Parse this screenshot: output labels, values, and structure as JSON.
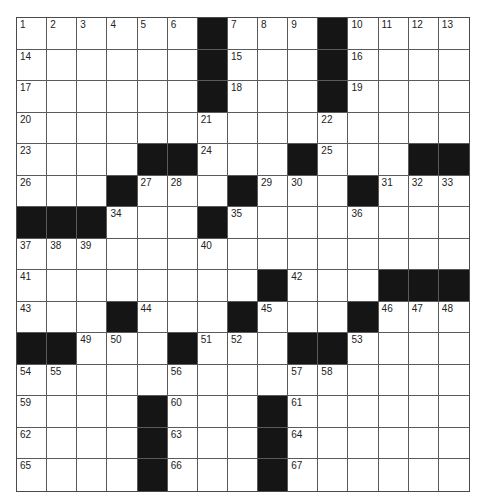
{
  "puzzle": {
    "size": {
      "rows": 15,
      "cols": 15
    },
    "colors": {
      "black": "#151515",
      "white": "#ffffff",
      "line": "#5a5a5a",
      "number": "#222222"
    },
    "layout": [
      "......#...#....",
      "......#...#....",
      "......#...#....",
      "...............",
      "....##...#...##",
      "...#...#...#...",
      "###...#........",
      "...............",
      "........#...###",
      "...#...#...#...",
      "##...#...##....",
      "...............",
      "....#...#......",
      "....#...#......",
      "....#...#......"
    ],
    "numbers": [
      {
        "r": 0,
        "c": 0,
        "n": "1"
      },
      {
        "r": 0,
        "c": 1,
        "n": "2"
      },
      {
        "r": 0,
        "c": 2,
        "n": "3"
      },
      {
        "r": 0,
        "c": 3,
        "n": "4"
      },
      {
        "r": 0,
        "c": 4,
        "n": "5"
      },
      {
        "r": 0,
        "c": 5,
        "n": "6"
      },
      {
        "r": 0,
        "c": 7,
        "n": "7"
      },
      {
        "r": 0,
        "c": 8,
        "n": "8"
      },
      {
        "r": 0,
        "c": 9,
        "n": "9"
      },
      {
        "r": 0,
        "c": 11,
        "n": "10"
      },
      {
        "r": 0,
        "c": 12,
        "n": "11"
      },
      {
        "r": 0,
        "c": 13,
        "n": "12"
      },
      {
        "r": 0,
        "c": 14,
        "n": "13"
      },
      {
        "r": 1,
        "c": 0,
        "n": "14"
      },
      {
        "r": 1,
        "c": 7,
        "n": "15"
      },
      {
        "r": 1,
        "c": 11,
        "n": "16"
      },
      {
        "r": 2,
        "c": 0,
        "n": "17"
      },
      {
        "r": 2,
        "c": 7,
        "n": "18"
      },
      {
        "r": 2,
        "c": 11,
        "n": "19"
      },
      {
        "r": 3,
        "c": 0,
        "n": "20"
      },
      {
        "r": 3,
        "c": 6,
        "n": "21"
      },
      {
        "r": 3,
        "c": 10,
        "n": "22"
      },
      {
        "r": 4,
        "c": 0,
        "n": "23"
      },
      {
        "r": 4,
        "c": 6,
        "n": "24"
      },
      {
        "r": 4,
        "c": 10,
        "n": "25"
      },
      {
        "r": 5,
        "c": 0,
        "n": "26"
      },
      {
        "r": 5,
        "c": 4,
        "n": "27"
      },
      {
        "r": 5,
        "c": 5,
        "n": "28"
      },
      {
        "r": 5,
        "c": 8,
        "n": "29"
      },
      {
        "r": 5,
        "c": 9,
        "n": "30"
      },
      {
        "r": 5,
        "c": 12,
        "n": "31"
      },
      {
        "r": 5,
        "c": 13,
        "n": "32"
      },
      {
        "r": 5,
        "c": 14,
        "n": "33"
      },
      {
        "r": 6,
        "c": 3,
        "n": "34"
      },
      {
        "r": 6,
        "c": 7,
        "n": "35"
      },
      {
        "r": 6,
        "c": 11,
        "n": "36"
      },
      {
        "r": 7,
        "c": 0,
        "n": "37"
      },
      {
        "r": 7,
        "c": 1,
        "n": "38"
      },
      {
        "r": 7,
        "c": 2,
        "n": "39"
      },
      {
        "r": 7,
        "c": 6,
        "n": "40"
      },
      {
        "r": 8,
        "c": 0,
        "n": "41"
      },
      {
        "r": 8,
        "c": 9,
        "n": "42"
      },
      {
        "r": 9,
        "c": 0,
        "n": "43"
      },
      {
        "r": 9,
        "c": 4,
        "n": "44"
      },
      {
        "r": 9,
        "c": 8,
        "n": "45"
      },
      {
        "r": 9,
        "c": 12,
        "n": "46"
      },
      {
        "r": 9,
        "c": 13,
        "n": "47"
      },
      {
        "r": 9,
        "c": 14,
        "n": "48"
      },
      {
        "r": 10,
        "c": 2,
        "n": "49"
      },
      {
        "r": 10,
        "c": 3,
        "n": "50"
      },
      {
        "r": 10,
        "c": 6,
        "n": "51"
      },
      {
        "r": 10,
        "c": 7,
        "n": "52"
      },
      {
        "r": 10,
        "c": 11,
        "n": "53"
      },
      {
        "r": 11,
        "c": 0,
        "n": "54"
      },
      {
        "r": 11,
        "c": 1,
        "n": "55"
      },
      {
        "r": 11,
        "c": 5,
        "n": "56"
      },
      {
        "r": 11,
        "c": 9,
        "n": "57"
      },
      {
        "r": 11,
        "c": 10,
        "n": "58"
      },
      {
        "r": 12,
        "c": 0,
        "n": "59"
      },
      {
        "r": 12,
        "c": 5,
        "n": "60"
      },
      {
        "r": 12,
        "c": 9,
        "n": "61"
      },
      {
        "r": 13,
        "c": 0,
        "n": "62"
      },
      {
        "r": 13,
        "c": 5,
        "n": "63"
      },
      {
        "r": 13,
        "c": 9,
        "n": "64"
      },
      {
        "r": 14,
        "c": 0,
        "n": "65"
      },
      {
        "r": 14,
        "c": 5,
        "n": "66"
      },
      {
        "r": 14,
        "c": 9,
        "n": "67"
      }
    ]
  }
}
